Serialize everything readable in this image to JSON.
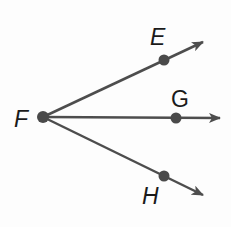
{
  "diagram": {
    "type": "rays-from-common-endpoint",
    "colors": {
      "line": "#4d4d4d",
      "point": "#4a4a4a",
      "label": "#1a1a1a",
      "background": "#fdfdfd"
    },
    "vertex": {
      "label": "F",
      "x": 43,
      "y": 117
    },
    "rays": [
      {
        "name": "ray-FE",
        "point_label": "E",
        "point": {
          "x": 164,
          "y": 60
        },
        "arrow_tip": {
          "x": 203,
          "y": 42
        }
      },
      {
        "name": "ray-FG",
        "point_label": "G",
        "point": {
          "x": 176,
          "y": 118
        },
        "arrow_tip": {
          "x": 220,
          "y": 118
        }
      },
      {
        "name": "ray-FH",
        "point_label": "H",
        "point": {
          "x": 164,
          "y": 176
        },
        "arrow_tip": {
          "x": 203,
          "y": 195
        }
      }
    ],
    "labels": {
      "F": "F",
      "E": "E",
      "G": "G",
      "H": "H"
    }
  }
}
